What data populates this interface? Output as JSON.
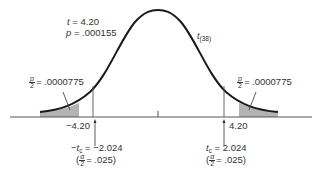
{
  "diagram": {
    "type": "t-distribution two-tailed test",
    "distribution_label": "t",
    "distribution_df": "(38)",
    "test_stat": {
      "symbol": "t",
      "value": "= 4.20"
    },
    "p_value": {
      "symbol": "p",
      "value": "= .000155"
    },
    "left_tail": {
      "frac_num": "p",
      "frac_den": "2",
      "value": "= .0000775",
      "t_value": "−4.20"
    },
    "right_tail": {
      "frac_num": "p",
      "frac_den": "2",
      "value": "= .0000775",
      "t_value": "4.20"
    },
    "left_critical": {
      "symbol": "−t",
      "subscript": "c",
      "value": "= −2.024",
      "alpha_num": "α",
      "alpha_den": "2",
      "alpha_value": "= .025)",
      "open_paren": "("
    },
    "right_critical": {
      "symbol": "t",
      "subscript": "c",
      "value": "= 2.024",
      "alpha_num": "α",
      "alpha_den": "2",
      "alpha_value": "= .025)",
      "open_paren": "("
    },
    "colors": {
      "curve": "#1a1a1a",
      "shade": "#b3b3b3",
      "axis": "#555555"
    }
  }
}
